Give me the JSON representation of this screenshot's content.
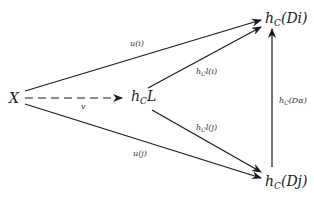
{
  "diagram": {
    "type": "commutative-diagram",
    "nodes": {
      "X": {
        "text": "X"
      },
      "hCL": {
        "base": "h",
        "sub": "C",
        "rest": "L"
      },
      "hCDi": {
        "base": "h",
        "sub": "C",
        "rest": "(Di)"
      },
      "hCDj": {
        "base": "h",
        "sub": "C",
        "rest": "(Dj)"
      }
    },
    "edges": [
      {
        "from": "X",
        "to": "hCDi",
        "label": "u(i)",
        "style": "solid"
      },
      {
        "from": "X",
        "to": "hCDj",
        "label": "u(j)",
        "style": "solid"
      },
      {
        "from": "X",
        "to": "hCL",
        "label": "v",
        "style": "dashed"
      },
      {
        "from": "hCL",
        "to": "hCDi",
        "label_base": "h",
        "label_sub": "C",
        "label_rest": "l(i)",
        "style": "solid"
      },
      {
        "from": "hCL",
        "to": "hCDj",
        "label_base": "h",
        "label_sub": "C",
        "label_rest": "l(j)",
        "style": "solid"
      },
      {
        "from": "hCDj",
        "to": "hCDi",
        "label_base": "h",
        "label_sub": "C",
        "label_rest": "(Dα)",
        "style": "solid"
      }
    ]
  }
}
